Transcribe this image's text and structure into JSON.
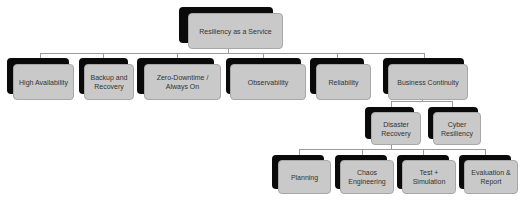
{
  "diagram": {
    "type": "hierarchy",
    "root": {
      "label": "Resiliency as a Service",
      "children": [
        {
          "label": "High Availability"
        },
        {
          "label": "Backup and\nRecovery"
        },
        {
          "label": "Zero-Downtime /\nAlways On"
        },
        {
          "label": "Observability"
        },
        {
          "label": "Reliability"
        },
        {
          "label": "Business Continuity",
          "children": [
            {
              "label": "Disaster\nRecovery",
              "children": [
                {
                  "label": "Planning"
                },
                {
                  "label": "Chaos\nEngineering"
                },
                {
                  "label": "Test +\nSimulation"
                },
                {
                  "label": "Evaluation &\nReport"
                }
              ]
            },
            {
              "label": "Cyber\nResiliency"
            }
          ]
        }
      ]
    }
  },
  "colors": {
    "box_fill": "#c9c9c9",
    "shadow": "#0a0a0a",
    "connector": "#9a9a9a",
    "text": "#333333"
  }
}
